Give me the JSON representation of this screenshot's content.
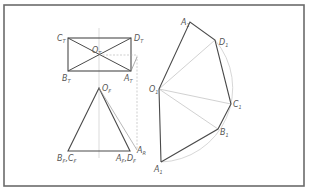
{
  "diagram": {
    "frame": {
      "x": 4,
      "y": 5,
      "w": 300,
      "h": 181,
      "color": "#6b6b6b"
    },
    "top_view": {
      "corners": {
        "C": [
          68,
          38
        ],
        "D": [
          131,
          38
        ],
        "B": [
          68,
          71
        ],
        "A": [
          131,
          71
        ]
      },
      "center": [
        99,
        55
      ],
      "labels": {
        "C": "C",
        "C_sub": "T",
        "D": "D",
        "D_sub": "T",
        "B": "B",
        "B_sub": "T",
        "A": "A",
        "A_sub": "T",
        "O": "O",
        "O_sub": "T"
      }
    },
    "front_view": {
      "apex": [
        99,
        88
      ],
      "base_left": [
        68,
        151
      ],
      "base_right": [
        130,
        151
      ],
      "labels": {
        "O": "O",
        "O_sub": "F",
        "BC": "B",
        "BC_sub1": "F",
        "BC_mid": ",C",
        "BC_sub2": "F",
        "AD": "A",
        "AD_sub1": "F",
        "AD_mid": ",D",
        "AD_sub2": "F",
        "AR": "A",
        "AR_sub": "R"
      }
    },
    "development": {
      "center": [
        159,
        89
      ],
      "points": {
        "A1_top": [
          190,
          22
        ],
        "D1": [
          215,
          40
        ],
        "C1": [
          231,
          104
        ],
        "B1": [
          218,
          129
        ],
        "A1_bottom": [
          161,
          162
        ]
      },
      "labels": {
        "O": "O",
        "O_sub": "1",
        "A_top": "A",
        "A_top_sub": "1",
        "D": "D",
        "D_sub": "1",
        "C": "C",
        "C_sub": "1",
        "B": "B",
        "B_sub": "1",
        "A_bottom": "A",
        "A_bottom_sub": "1"
      }
    },
    "colors": {
      "main_line": "#4a4a4a",
      "construction_line": "#b8b8b8",
      "label": "#5a5a5a"
    }
  }
}
